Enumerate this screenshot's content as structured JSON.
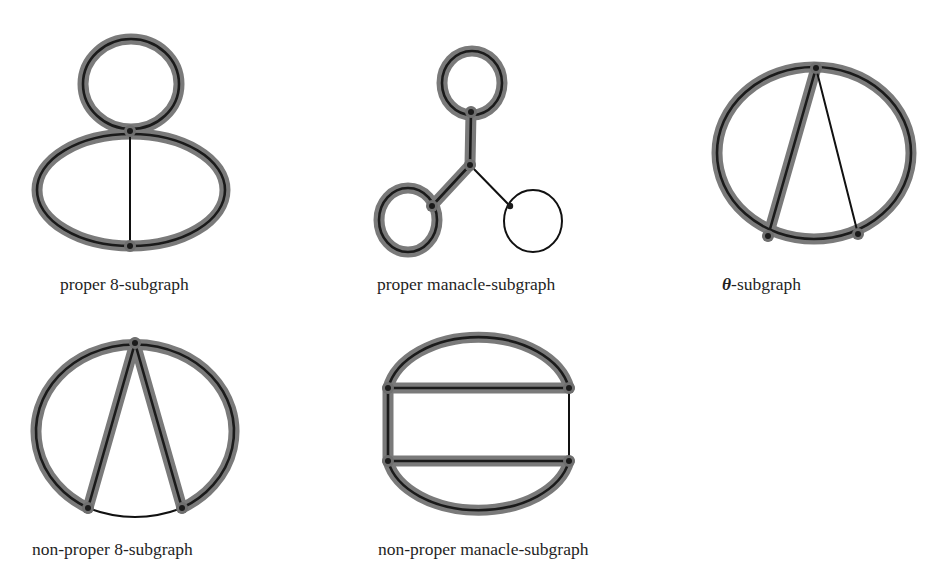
{
  "figure": {
    "colors": {
      "highlight": "#7a7a7a",
      "edge": "#1a1a1a",
      "background": "#ffffff"
    },
    "panels": [
      {
        "id": "proper-8",
        "label": "proper 8-subgraph",
        "highlighted": [
          "top-loop",
          "bottom-ellipse"
        ],
        "plain": [
          "vertical-chord"
        ]
      },
      {
        "id": "proper-manacle",
        "label": "proper manacle-subgraph",
        "highlighted": [
          "top-loop",
          "top-stem",
          "left-arm",
          "left-loop"
        ],
        "plain": [
          "right-arm",
          "right-loop"
        ]
      },
      {
        "id": "theta",
        "label_symbol": "θ",
        "label_rest": "-subgraph",
        "highlighted": [
          "outer-ellipse",
          "left-chord"
        ],
        "plain": [
          "right-chord"
        ]
      },
      {
        "id": "non-proper-8",
        "label": "non-proper 8-subgraph",
        "highlighted": [
          "outer-ellipse-upper",
          "left-chord",
          "right-chord"
        ],
        "plain": [
          "bottom-arc"
        ]
      },
      {
        "id": "non-proper-manacle",
        "label": "non-proper manacle-subgraph",
        "highlighted": [
          "top-arc",
          "upper-bar",
          "left-side",
          "lower-bar",
          "bottom-arc"
        ],
        "plain": [
          "right-side"
        ]
      }
    ]
  }
}
